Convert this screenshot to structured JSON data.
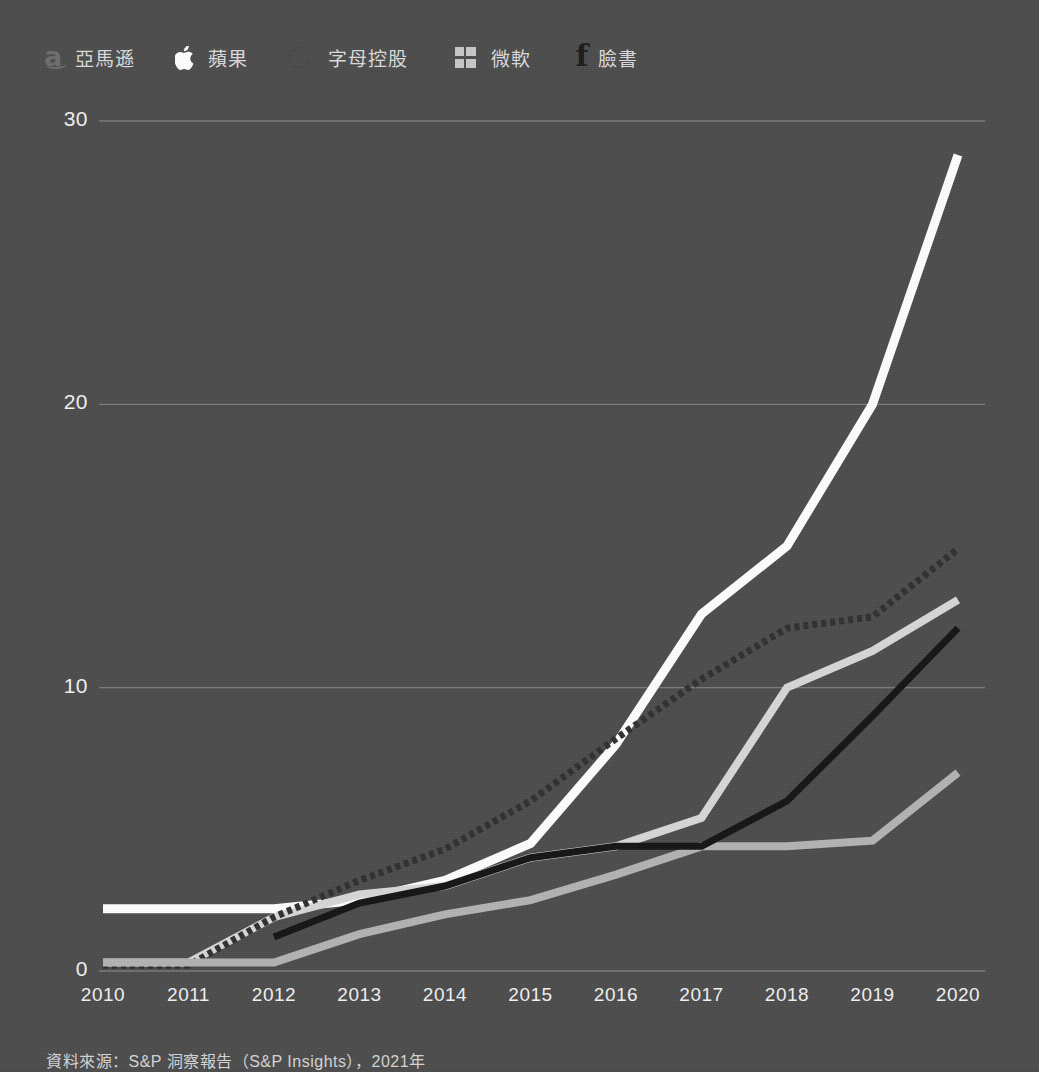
{
  "legend": {
    "items": [
      {
        "label": "亞馬遜",
        "icon": "amazon-icon",
        "color": "#ffffff",
        "key": "amazon"
      },
      {
        "label": "蘋果",
        "icon": "apple-icon",
        "color": "#d8d8d8",
        "key": "apple"
      },
      {
        "label": "字母控股",
        "icon": "alphabet-icon",
        "color": "#2e2e2e",
        "key": "alphabet"
      },
      {
        "label": "微軟",
        "icon": "microsoft-icon",
        "color": "#c9c9c9",
        "key": "microsoft"
      },
      {
        "label": "臉書",
        "icon": "facebook-icon",
        "color": "#161616",
        "key": "facebook"
      }
    ]
  },
  "axes": {
    "y_ticks": [
      "0",
      "10",
      "20",
      "30"
    ],
    "x_ticks": [
      "2010",
      "2011",
      "2012",
      "2013",
      "2014",
      "2015",
      "2016",
      "2017",
      "2018",
      "2019",
      "2020"
    ],
    "ylim": [
      0,
      30
    ],
    "grid": true
  },
  "source": {
    "text": "資料來源：S&P 洞察報告（S&P Insights），2021年"
  },
  "chart_data": {
    "type": "line",
    "title": "",
    "xlabel": "",
    "ylabel": "",
    "ylim": [
      0,
      30
    ],
    "grid": true,
    "legend_position": "top-left",
    "x": [
      "2010",
      "2011",
      "2012",
      "2013",
      "2014",
      "2015",
      "2016",
      "2017",
      "2018",
      "2019",
      "2020"
    ],
    "series": [
      {
        "name": "亞馬遜",
        "key": "amazon",
        "color": "#ffffff",
        "width": 9,
        "values": [
          2.2,
          2.2,
          2.2,
          2.5,
          3.2,
          4.5,
          8.0,
          12.6,
          15.0,
          20.0,
          28.8
        ]
      },
      {
        "name": "蘋果",
        "key": "apple",
        "color": "#d8d8d8",
        "width": 8,
        "values": [
          0.3,
          0.3,
          1.9,
          2.7,
          3.0,
          4.0,
          4.4,
          5.4,
          10.0,
          11.3,
          13.1
        ]
      },
      {
        "name": "字母控股",
        "key": "alphabet",
        "color": "#303030",
        "width": 7,
        "dashed": true,
        "values": [
          0.2,
          0.2,
          1.9,
          3.2,
          4.3,
          6.0,
          8.2,
          10.3,
          12.1,
          12.5,
          14.9
        ]
      },
      {
        "name": "微軟",
        "key": "microsoft",
        "color": "#b4b4b4",
        "width": 8,
        "values": [
          0.3,
          0.3,
          0.3,
          1.3,
          2.0,
          2.5,
          3.4,
          4.4,
          4.4,
          4.6,
          7.0
        ]
      },
      {
        "name": "臉書",
        "key": "facebook",
        "color": "#141414",
        "width": 7,
        "values": [
          null,
          null,
          1.2,
          2.4,
          3.0,
          4.0,
          4.4,
          4.4,
          6.0,
          9.0,
          12.1
        ]
      }
    ]
  }
}
